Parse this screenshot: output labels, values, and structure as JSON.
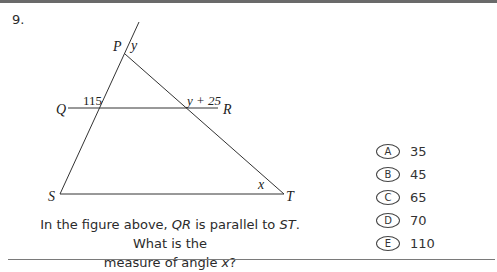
{
  "question": {
    "number": "9.",
    "text_parts": {
      "p1": "In the figure above, ",
      "seg1": "QR",
      "p2": " is parallel to ",
      "seg2": "ST",
      "p3": ". What is the",
      "p4": "measure of angle ",
      "var": "x",
      "p5": "?"
    }
  },
  "figure": {
    "points": {
      "P": "P",
      "Q": "Q",
      "R": "R",
      "S": "S",
      "T": "T"
    },
    "angle_labels": {
      "at_P": "y",
      "at_QR_left": "115",
      "at_QR_right": "y + 25",
      "at_T": "x"
    }
  },
  "choices": [
    {
      "letter": "A",
      "value": "35"
    },
    {
      "letter": "B",
      "value": "45"
    },
    {
      "letter": "C",
      "value": "65"
    },
    {
      "letter": "D",
      "value": "70"
    },
    {
      "letter": "E",
      "value": "110"
    }
  ]
}
